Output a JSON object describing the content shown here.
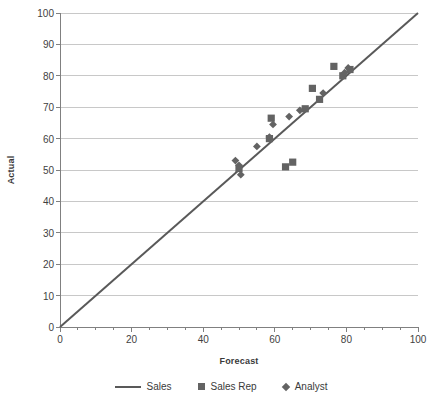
{
  "chart_data": {
    "type": "scatter",
    "title": "",
    "xlabel": "Forecast",
    "ylabel": "Actual",
    "xlim": [
      0,
      100
    ],
    "ylim": [
      0,
      100
    ],
    "x_ticks": [
      0,
      20,
      40,
      60,
      80,
      100
    ],
    "y_ticks": [
      0,
      10,
      20,
      30,
      40,
      50,
      60,
      70,
      80,
      90,
      100
    ],
    "x_minor_tick_step": 5,
    "grid": "horizontal",
    "legend_position": "bottom",
    "colors": {
      "line": "#595959",
      "sales_rep_marker": "#636363",
      "analyst_marker": "#636363",
      "gridline": "#c8c8c8",
      "axis": "#808080",
      "text": "#3f3f3f"
    },
    "series": [
      {
        "name": "Sales",
        "type": "line",
        "marker": "none",
        "points": [
          [
            0,
            0
          ],
          [
            100,
            100
          ]
        ]
      },
      {
        "name": "Sales Rep",
        "type": "scatter",
        "marker": "square",
        "points": [
          [
            50.0,
            50.5
          ],
          [
            58.5,
            60.0
          ],
          [
            59.0,
            66.5
          ],
          [
            63.0,
            51.0
          ],
          [
            65.0,
            52.5
          ],
          [
            68.5,
            69.5
          ],
          [
            70.5,
            76.0
          ],
          [
            72.5,
            72.5
          ],
          [
            76.5,
            83.0
          ],
          [
            79.0,
            80.0
          ],
          [
            81.0,
            82.0
          ]
        ]
      },
      {
        "name": "Analyst",
        "type": "scatter",
        "marker": "diamond",
        "points": [
          [
            49.0,
            53.0
          ],
          [
            50.0,
            51.5
          ],
          [
            50.5,
            48.5
          ],
          [
            55.0,
            57.5
          ],
          [
            58.5,
            60.5
          ],
          [
            59.5,
            64.5
          ],
          [
            64.0,
            67.0
          ],
          [
            67.0,
            69.0
          ],
          [
            73.5,
            74.5
          ],
          [
            79.5,
            81.0
          ],
          [
            80.5,
            82.5
          ]
        ]
      }
    ]
  }
}
